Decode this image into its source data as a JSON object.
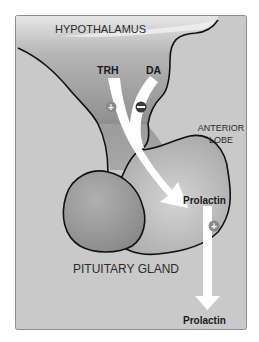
{
  "diagram": {
    "labels": {
      "hypothalamus": "HYPOTHALAMUS",
      "trh": "TRH",
      "da": "DA",
      "anterior_lobe_line1": "ANTERIOR",
      "anterior_lobe_line2": "LOBE",
      "prolactin_gland": "Prolactin",
      "pituitary": "PITUITARY GLAND",
      "prolactin_out": "Prolactin"
    },
    "signs": {
      "trh_effect": "+",
      "da_effect": "−",
      "prolactin_effect": "+"
    },
    "colors": {
      "background_box": "#c9c9c9",
      "tissue": "#9a9a9a",
      "tissue_light": "#bdbdbd",
      "arrow": "#ffffff",
      "outline": "#111111",
      "plus_badge": "#8a8a8a",
      "minus_badge": "#3a3a3a"
    }
  }
}
